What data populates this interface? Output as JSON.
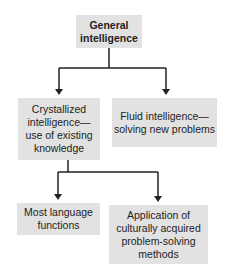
{
  "diagram": {
    "type": "hierarchy",
    "root": {
      "label": "General intelligence"
    },
    "level1": [
      {
        "label": "Crystallized intelligence—use of existing knowledge"
      },
      {
        "label": "Fluid intelligence—solving new problems"
      }
    ],
    "level2": [
      {
        "label": "Most language functions",
        "parent": "Crystallized intelligence"
      },
      {
        "label": "Application of culturally acquired problem-solving methods",
        "parent": "Crystallized intelligence"
      }
    ],
    "colors": {
      "box_fill": "#e2e2e2",
      "line": "#222222"
    }
  }
}
